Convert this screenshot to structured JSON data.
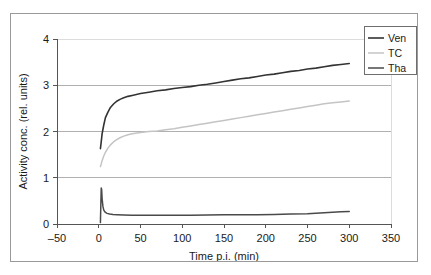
{
  "chart_data": {
    "type": "line",
    "title": "",
    "xlabel": "Time p.i. (min)",
    "ylabel": "Activity conc. (rel. units)",
    "xlim": [
      -50,
      350
    ],
    "ylim": [
      0,
      4
    ],
    "xticks": [
      "-50",
      "0",
      "50",
      "100",
      "150",
      "200",
      "250",
      "300",
      "350"
    ],
    "xtick_values": [
      -50,
      0,
      50,
      100,
      150,
      200,
      250,
      300,
      350
    ],
    "yticks": [
      "0",
      "1",
      "2",
      "3",
      "4"
    ],
    "ytick_values": [
      0,
      1,
      2,
      3,
      4
    ],
    "grid": "horizontal",
    "legend_position": "top-right",
    "series": [
      {
        "name": "Ven",
        "color": "#333333",
        "width": 1.6,
        "x": [
          2,
          3,
          4,
          6,
          8,
          11,
          14,
          18,
          22,
          26,
          30,
          35,
          40,
          50,
          60,
          70,
          80,
          90,
          100,
          110,
          120,
          130,
          140,
          150,
          160,
          170,
          180,
          190,
          200,
          210,
          220,
          230,
          240,
          250,
          260,
          270,
          280,
          290,
          300
        ],
        "y": [
          1.63,
          1.78,
          1.95,
          2.14,
          2.3,
          2.42,
          2.52,
          2.6,
          2.66,
          2.7,
          2.73,
          2.76,
          2.78,
          2.82,
          2.85,
          2.88,
          2.9,
          2.93,
          2.95,
          2.97,
          3.0,
          3.02,
          3.05,
          3.08,
          3.11,
          3.14,
          3.16,
          3.19,
          3.22,
          3.24,
          3.27,
          3.3,
          3.32,
          3.35,
          3.37,
          3.4,
          3.43,
          3.45,
          3.47
        ]
      },
      {
        "name": "TC",
        "color": "#c4c4c4",
        "width": 1.5,
        "x": [
          2,
          3,
          4,
          6,
          8,
          11,
          14,
          18,
          22,
          26,
          30,
          35,
          40,
          50,
          60,
          70,
          80,
          90,
          100,
          110,
          120,
          130,
          140,
          150,
          160,
          170,
          180,
          190,
          200,
          210,
          220,
          230,
          240,
          250,
          260,
          270,
          280,
          290,
          300
        ],
        "y": [
          1.24,
          1.3,
          1.37,
          1.47,
          1.55,
          1.64,
          1.71,
          1.78,
          1.83,
          1.87,
          1.9,
          1.93,
          1.95,
          1.98,
          2.0,
          2.01,
          2.04,
          2.06,
          2.09,
          2.12,
          2.15,
          2.18,
          2.21,
          2.24,
          2.27,
          2.3,
          2.33,
          2.36,
          2.39,
          2.42,
          2.45,
          2.48,
          2.51,
          2.54,
          2.57,
          2.6,
          2.62,
          2.64,
          2.66
        ]
      },
      {
        "name": "Tha",
        "color": "#4a4a4a",
        "width": 1.5,
        "x": [
          2,
          2.5,
          3,
          3.5,
          4,
          5,
          6,
          8,
          10,
          13,
          17,
          22,
          30,
          40,
          55,
          70,
          90,
          110,
          130,
          150,
          170,
          190,
          210,
          230,
          250,
          265,
          280,
          290,
          300
        ],
        "y": [
          0.03,
          0.42,
          0.78,
          0.74,
          0.55,
          0.38,
          0.3,
          0.25,
          0.23,
          0.215,
          0.205,
          0.2,
          0.195,
          0.19,
          0.19,
          0.19,
          0.19,
          0.19,
          0.195,
          0.2,
          0.2,
          0.2,
          0.205,
          0.215,
          0.22,
          0.24,
          0.255,
          0.265,
          0.27
        ]
      }
    ]
  },
  "legend": {
    "entries": [
      {
        "label": "Ven"
      },
      {
        "label": "TC"
      },
      {
        "label": "Tha"
      }
    ]
  },
  "colors": {
    "grid": "#b0b0b0",
    "grid_light": "#dcdcdc",
    "axis": "#555555",
    "frame": "#9a9a9a",
    "text": "#1a1a1a"
  }
}
